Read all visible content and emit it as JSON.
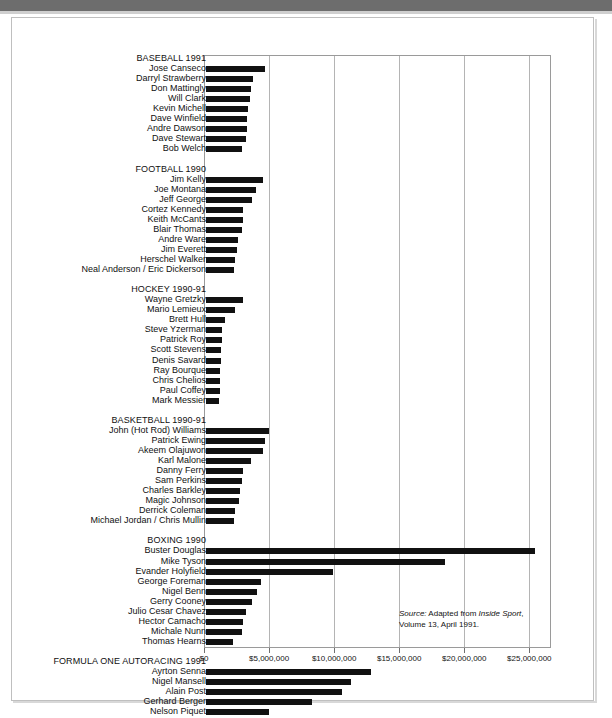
{
  "chart_data": {
    "type": "bar",
    "title": "",
    "xlabel": "",
    "ylabel": "",
    "orientation": "horizontal",
    "grid": true,
    "legend": "none",
    "xlim": [
      0,
      26666666
    ],
    "xticks": [
      0,
      5000000,
      10000000,
      15000000,
      20000000,
      25000000
    ],
    "xtick_labels": [
      "$0",
      "$5,000,000",
      "$10,000,000",
      "$15,000,000",
      "$20,000,000",
      "$25,000,000"
    ],
    "groups": [
      {
        "header": "BASEBALL 1991",
        "categories": [
          "Jose Canseco",
          "Darryl Strawberry",
          "Don Mattingly",
          "Will Clark",
          "Kevin Michell",
          "Dave Winfield",
          "Andre Dawson",
          "Dave Stewart",
          "Bob Welch"
        ],
        "values": [
          4700000,
          3800000,
          3600000,
          3500000,
          3400000,
          3300000,
          3300000,
          3200000,
          2900000
        ]
      },
      {
        "header": "FOOTBALL 1990",
        "categories": [
          "Jim Kelly",
          "Joe Montana",
          "Jeff George",
          "Cortez Kennedy",
          "Keith McCants",
          "Blair Thomas",
          "Andre Ware",
          "Jim Everett",
          "Herschel Walker",
          "Neal Anderson / Eric Dickerson"
        ],
        "values": [
          4500000,
          4000000,
          3700000,
          3000000,
          3000000,
          2900000,
          2600000,
          2500000,
          2400000,
          2300000
        ]
      },
      {
        "header": "HOCKEY 1990-91",
        "categories": [
          "Wayne Gretzky",
          "Mario Lemieux",
          "Brett Hull",
          "Steve Yzerman",
          "Patrick Roy",
          "Scott Stevens",
          "Denis Savard",
          "Ray Bourque",
          "Chris Chelios",
          "Paul Coffey",
          "Mark Messier"
        ],
        "values": [
          3000000,
          2400000,
          1600000,
          1400000,
          1350000,
          1300000,
          1280000,
          1260000,
          1250000,
          1200000,
          1150000
        ]
      },
      {
        "header": "BASKETBALL 1990-91",
        "categories": [
          "John (Hot Rod) Williams",
          "Patrick Ewing",
          "Akeem Olajuwon",
          "Karl Malone",
          "Danny Ferry",
          "Sam Perkins",
          "Charles Barkley",
          "Magic Johnson",
          "Derrick Coleman",
          "Michael Jordan / Chris Mullin"
        ],
        "values": [
          5000000,
          4700000,
          4500000,
          3600000,
          3000000,
          2900000,
          2800000,
          2700000,
          2400000,
          2300000
        ]
      },
      {
        "header": "BOXING 1990",
        "categories": [
          "Buster Douglas",
          "Mike Tyson",
          "Evander Holyfield",
          "George Foreman",
          "Nigel Benn",
          "Gerry Cooney",
          "Julio Cesar Chavez",
          "Hector Camacho",
          "Michale Nunn",
          "Thomas Hearns"
        ],
        "values": [
          25400000,
          18500000,
          9900000,
          4400000,
          4100000,
          3700000,
          3200000,
          3000000,
          2900000,
          2200000
        ]
      },
      {
        "header": "FORMULA ONE AUTORACING 1991",
        "categories": [
          "Ayrton Senna",
          "Nigel Mansell",
          "Alain Post",
          "Gerhard Berger",
          "Nelson Piquet"
        ],
        "values": [
          12800000,
          11300000,
          10600000,
          8300000,
          5000000
        ]
      }
    ]
  },
  "source": {
    "prefix": "Source:",
    "text_before": " Adapted from ",
    "publication": "Inside Sport",
    "text_after": ", Volume 13, April 1991."
  }
}
